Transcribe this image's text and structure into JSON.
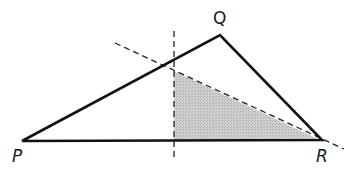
{
  "diagram": {
    "type": "geometry",
    "shape": "triangle",
    "vertices": {
      "P": {
        "label": "P",
        "x": 22,
        "y": 141
      },
      "Q": {
        "label": "Q",
        "x": 220,
        "y": 35
      },
      "R": {
        "label": "R",
        "x": 322,
        "y": 140
      }
    },
    "shaded_region": {
      "points": [
        [
          174,
          71
        ],
        [
          174,
          141
        ],
        [
          320,
          140
        ]
      ],
      "fill": "#c9c9c9"
    },
    "dashed_lines": [
      {
        "name": "vertical-line",
        "x1": 174,
        "y1": 31,
        "x2": 174,
        "y2": 161
      },
      {
        "name": "diagonal-line",
        "x1": 115,
        "y1": 43,
        "x2": 344,
        "y2": 149
      }
    ],
    "colors": {
      "stroke": "#111111",
      "shade": "#c9c9c9"
    }
  }
}
